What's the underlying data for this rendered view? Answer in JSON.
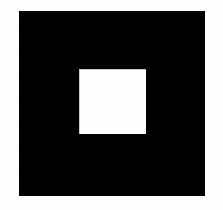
{
  "figure": {
    "name": "square-within-square",
    "canvas": {
      "width": 223,
      "height": 210,
      "background_color": "#ffffff"
    },
    "shapes": [
      {
        "name": "outer-square",
        "kind": "square",
        "fill_color": "#000000",
        "x": 19,
        "y": 11,
        "width": 186,
        "height": 185
      },
      {
        "name": "inner-square",
        "kind": "square",
        "fill_color": "#ffffff",
        "edge_color": "#c9c9c9",
        "x": 79,
        "y": 69,
        "width": 67,
        "height": 65
      }
    ]
  },
  "chart_data": {
    "type": "table",
    "title": "",
    "xlabel": "",
    "ylabel": "",
    "columns": [
      "Region",
      "Fill",
      "X",
      "Y",
      "Width",
      "Height"
    ],
    "rows": [
      [
        "Background",
        "#ffffff",
        0,
        0,
        223,
        210
      ],
      [
        "Outer square",
        "#000000",
        19,
        11,
        186,
        185
      ],
      [
        "Inner square",
        "#ffffff",
        79,
        69,
        67,
        65
      ]
    ]
  }
}
